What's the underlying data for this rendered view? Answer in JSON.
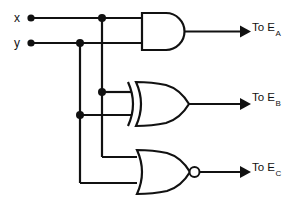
{
  "diagram": {
    "type": "logic-circuit",
    "background_color": "#ffffff",
    "line_color": "#111111",
    "inputs": [
      {
        "id": "x",
        "label": "x",
        "y": 18
      },
      {
        "id": "y",
        "label": "y",
        "y": 43
      }
    ],
    "gates": [
      {
        "id": "gate-and",
        "kind": "AND",
        "icon": "and-gate-icon",
        "inputs": [
          "x",
          "y"
        ],
        "output_label": "To E",
        "output_subscript": "A"
      },
      {
        "id": "gate-xor",
        "kind": "XOR",
        "icon": "xor-gate-icon",
        "inputs": [
          "x",
          "y"
        ],
        "output_label": "To E",
        "output_subscript": "B"
      },
      {
        "id": "gate-nor",
        "kind": "NOR",
        "icon": "nor-gate-icon",
        "inputs": [
          "x",
          "y"
        ],
        "output_label": "To E",
        "output_subscript": "C"
      }
    ],
    "outputs": [
      {
        "id": "out-a",
        "text": "To E",
        "subscript": "A"
      },
      {
        "id": "out-b",
        "text": "To E",
        "subscript": "B"
      },
      {
        "id": "out-c",
        "text": "To E",
        "subscript": "C"
      }
    ],
    "junction_dots": 4,
    "terminal_dots": 2
  }
}
